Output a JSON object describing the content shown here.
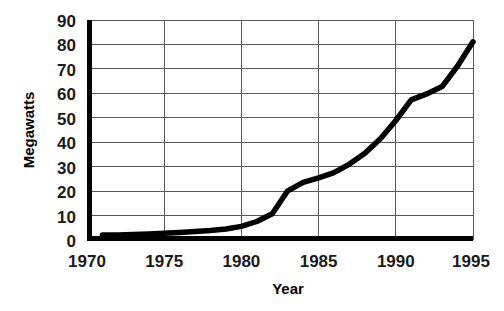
{
  "chart_data": {
    "type": "line",
    "title": "",
    "xlabel": "Year",
    "ylabel": "Megawatts",
    "xlim": [
      1970,
      1995
    ],
    "ylim": [
      0,
      90
    ],
    "grid": true,
    "legend": false,
    "x_ticks": [
      1970,
      1975,
      1980,
      1985,
      1990,
      1995
    ],
    "x_tick_labels": [
      "1970",
      "1975",
      "1980",
      "1985",
      "1990",
      "1995"
    ],
    "y_ticks": [
      0,
      10,
      20,
      30,
      40,
      50,
      60,
      70,
      80,
      90
    ],
    "y_tick_labels": [
      "0",
      "10",
      "20",
      "30",
      "40",
      "50",
      "60",
      "70",
      "80",
      "90"
    ],
    "series": [
      {
        "name": "Megawatts",
        "color": "#000000",
        "x": [
          1971,
          1972,
          1973,
          1974,
          1975,
          1976,
          1977,
          1978,
          1979,
          1980,
          1981,
          1982,
          1983,
          1984,
          1985,
          1986,
          1987,
          1988,
          1989,
          1990,
          1991,
          1992,
          1993,
          1994,
          1995
        ],
        "values": [
          1.2,
          1.3,
          1.5,
          1.7,
          2.0,
          2.3,
          2.7,
          3.1,
          3.7,
          4.8,
          6.8,
          10.0,
          19.5,
          23.0,
          24.8,
          27.0,
          30.5,
          35.0,
          41.0,
          48.5,
          57.0,
          59.5,
          62.5,
          71.0,
          81.0
        ]
      }
    ]
  },
  "axis_titles": {
    "x": "Year",
    "y": "Megawatts"
  }
}
